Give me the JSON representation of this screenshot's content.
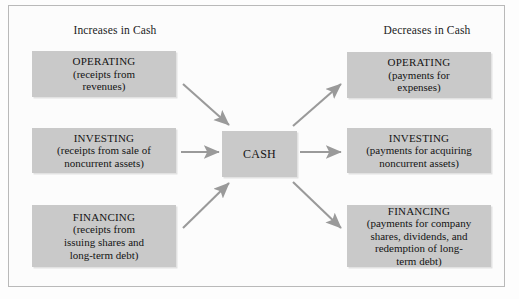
{
  "diagram": {
    "frame": {
      "border_color": "#b9b9b9",
      "background": "#fcfcfc"
    },
    "palette": {
      "box_fill": "#c9c9c9",
      "arrow": "#9a9a9a",
      "text": "#141414",
      "frame_border": "#b9b9b9"
    },
    "headers": {
      "left": "Increases in Cash",
      "right": "Decreases in Cash"
    },
    "center": {
      "label": "CASH"
    },
    "left_nodes": [
      {
        "id": "left-operating",
        "title": "OPERATING",
        "detail": "(receipts from\nrevenues)"
      },
      {
        "id": "left-investing",
        "title": "INVESTING",
        "detail": "(receipts from sale of\nnoncurrent assets)"
      },
      {
        "id": "left-financing",
        "title": "FINANCING",
        "detail": "(receipts from\nissuing shares and\nlong-term debt)"
      }
    ],
    "right_nodes": [
      {
        "id": "right-operating",
        "title": "OPERATING",
        "detail": "(payments for\nexpenses)"
      },
      {
        "id": "right-investing",
        "title": "INVESTING",
        "detail": "(payments for acquiring\nnoncurrent assets)"
      },
      {
        "id": "right-financing",
        "title": "FINANCING",
        "detail": "(payments for company\nshares, dividends, and\nredemption of long-\nterm debt)"
      }
    ],
    "arrows": [
      {
        "name": "arrow-left-operating-to-cash",
        "direction": "inflow"
      },
      {
        "name": "arrow-left-investing-to-cash",
        "direction": "inflow"
      },
      {
        "name": "arrow-left-financing-to-cash",
        "direction": "inflow"
      },
      {
        "name": "arrow-cash-to-right-operating",
        "direction": "outflow"
      },
      {
        "name": "arrow-cash-to-right-investing",
        "direction": "outflow"
      },
      {
        "name": "arrow-cash-to-right-financing",
        "direction": "outflow"
      }
    ]
  }
}
